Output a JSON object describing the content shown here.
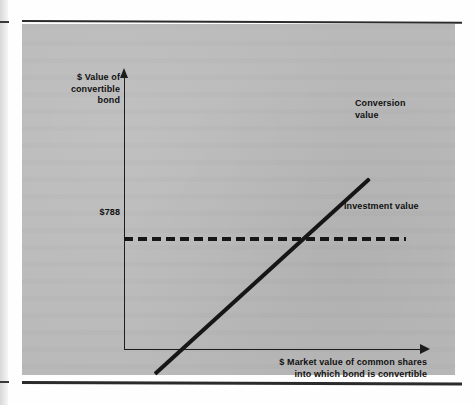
{
  "figure": {
    "panel_color": "#b9b9b9",
    "ink_color": "#161616"
  },
  "axes": {
    "y_title": "$ Value of\nconvertible\nbond",
    "x_title": "$ Market value of common shares\ninto which bond is convertible",
    "y_tick_label": "$788"
  },
  "series_labels": {
    "conversion": "Conversion\nvalue",
    "investment": "Investment value"
  },
  "chart_data": {
    "type": "line",
    "title": "",
    "xlabel": "$ Market value of common shares into which bond is convertible",
    "ylabel": "$ Value of convertible bond",
    "grid": false,
    "legend_position": "inline-annotations",
    "xlim": [
      0,
      100
    ],
    "ylim": [
      0,
      100
    ],
    "axis_tick_labels": {
      "y": [
        "$788"
      ],
      "x": []
    },
    "annotations": [
      {
        "text": "Conversion value",
        "x": 82,
        "y": 88
      },
      {
        "text": "Investment value",
        "x": 78,
        "y": 55
      },
      {
        "text": "$788",
        "x": -8,
        "y": 41
      }
    ],
    "series": [
      {
        "name": "Conversion value",
        "style": "solid",
        "linewidth": 4,
        "x": [
          -11,
          100
        ],
        "values": [
          -8,
          89
        ]
      },
      {
        "name": "Investment value",
        "style": "dashed",
        "linewidth": 4,
        "x": [
          0,
          95
        ],
        "values": [
          41,
          41
        ]
      }
    ],
    "intersection": {
      "x": 55,
      "y": 41,
      "label": "$788"
    }
  }
}
